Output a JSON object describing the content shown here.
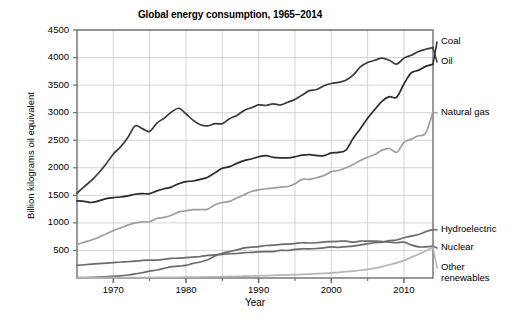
{
  "chart_data": {
    "type": "line",
    "title": "Global energy consumption, 1965–2014",
    "xlabel": "Year",
    "ylabel": "Billion kilograms oil equivalent",
    "xlim": [
      1965,
      2014
    ],
    "ylim": [
      0,
      4500
    ],
    "xticks": [
      1970,
      1980,
      1990,
      2000,
      2010
    ],
    "xtick_labels": [
      "1970",
      "1980",
      "1990",
      "2000",
      "2010"
    ],
    "yticks": [
      500,
      1000,
      1500,
      2000,
      2500,
      3000,
      3500,
      4000,
      4500
    ],
    "ytick_labels": [
      "500",
      "1000",
      "1500",
      "2000",
      "2500",
      "3000",
      "3500",
      "4000",
      "4500"
    ],
    "grid": true,
    "legend_position": "right-inline-labels",
    "x": [
      1965,
      1966,
      1967,
      1968,
      1969,
      1970,
      1971,
      1972,
      1973,
      1974,
      1975,
      1976,
      1977,
      1978,
      1979,
      1980,
      1981,
      1982,
      1983,
      1984,
      1985,
      1986,
      1987,
      1988,
      1989,
      1990,
      1991,
      1992,
      1993,
      1994,
      1995,
      1996,
      1997,
      1998,
      1999,
      2000,
      2001,
      2002,
      2003,
      2004,
      2005,
      2006,
      2007,
      2008,
      2009,
      2010,
      2011,
      2012,
      2013,
      2014
    ],
    "series": [
      {
        "name": "Coal",
        "color": "#2b2b2b",
        "values": [
          1400,
          1390,
          1370,
          1400,
          1440,
          1460,
          1470,
          1490,
          1520,
          1530,
          1530,
          1580,
          1620,
          1650,
          1710,
          1750,
          1760,
          1790,
          1830,
          1910,
          1990,
          2020,
          2080,
          2130,
          2160,
          2200,
          2220,
          2190,
          2180,
          2180,
          2200,
          2230,
          2240,
          2220,
          2220,
          2270,
          2280,
          2320,
          2530,
          2710,
          2900,
          3060,
          3210,
          3290,
          3280,
          3520,
          3720,
          3770,
          3840,
          3880
        ]
      },
      {
        "name": "Oil",
        "color": "#3a3a3a",
        "values": [
          1540,
          1660,
          1770,
          1910,
          2070,
          2250,
          2380,
          2550,
          2760,
          2710,
          2660,
          2810,
          2900,
          3010,
          3080,
          2980,
          2860,
          2780,
          2760,
          2800,
          2800,
          2890,
          2950,
          3040,
          3090,
          3140,
          3130,
          3160,
          3140,
          3190,
          3240,
          3320,
          3400,
          3420,
          3490,
          3530,
          3550,
          3590,
          3680,
          3830,
          3910,
          3950,
          3990,
          3950,
          3880,
          3990,
          4040,
          4110,
          4150,
          4180
        ]
      },
      {
        "name": "Natural gas",
        "color": "#9e9e9e",
        "values": [
          610,
          650,
          690,
          740,
          800,
          860,
          910,
          960,
          1000,
          1020,
          1020,
          1080,
          1100,
          1140,
          1200,
          1220,
          1240,
          1240,
          1250,
          1330,
          1370,
          1390,
          1450,
          1510,
          1570,
          1600,
          1620,
          1630,
          1650,
          1660,
          1710,
          1790,
          1790,
          1820,
          1860,
          1930,
          1950,
          2000,
          2060,
          2130,
          2190,
          2240,
          2320,
          2350,
          2280,
          2460,
          2520,
          2580,
          2630,
          3010
        ]
      },
      {
        "name": "Hydroelectric",
        "color": "#6b6b6b",
        "values": [
          230,
          240,
          250,
          260,
          270,
          280,
          290,
          295,
          305,
          320,
          325,
          325,
          340,
          355,
          360,
          370,
          380,
          390,
          410,
          420,
          430,
          440,
          445,
          460,
          465,
          475,
          480,
          480,
          500,
          500,
          520,
          530,
          530,
          535,
          545,
          565,
          555,
          570,
          580,
          600,
          620,
          640,
          650,
          680,
          690,
          730,
          760,
          790,
          840,
          880
        ]
      },
      {
        "name": "Nuclear",
        "color": "#6b6b6b",
        "values": [
          5,
          8,
          12,
          17,
          23,
          30,
          40,
          55,
          75,
          95,
          125,
          145,
          175,
          205,
          215,
          230,
          265,
          290,
          330,
          400,
          450,
          480,
          510,
          545,
          560,
          570,
          590,
          595,
          610,
          615,
          625,
          640,
          635,
          640,
          655,
          660,
          665,
          670,
          650,
          670,
          670,
          670,
          660,
          650,
          640,
          650,
          600,
          565,
          565,
          575
        ]
      },
      {
        "name": "Other renewables",
        "color": "#b5b5b5",
        "values": [
          3,
          3,
          4,
          4,
          5,
          5,
          6,
          6,
          7,
          8,
          9,
          10,
          11,
          12,
          13,
          15,
          16,
          18,
          20,
          22,
          25,
          27,
          30,
          33,
          36,
          40,
          43,
          47,
          51,
          55,
          60,
          65,
          71,
          78,
          85,
          94,
          103,
          114,
          126,
          141,
          158,
          180,
          206,
          240,
          275,
          320,
          375,
          430,
          490,
          560
        ]
      }
    ]
  },
  "series_labels": [
    {
      "name": "Coal",
      "text": "Coal"
    },
    {
      "name": "Oil",
      "text": "Oil"
    },
    {
      "name": "Natural gas",
      "text": "Natural gas"
    },
    {
      "name": "Hydroelectric",
      "text": "Hydroelectric"
    },
    {
      "name": "Nuclear",
      "text": "Nuclear"
    },
    {
      "name": "Other renewables",
      "text": "Other\nrenewables"
    }
  ],
  "colors": {
    "axis": "#6e6e6e",
    "grid": "#c9c9c9",
    "background": "#ffffff",
    "text": "#000000"
  }
}
